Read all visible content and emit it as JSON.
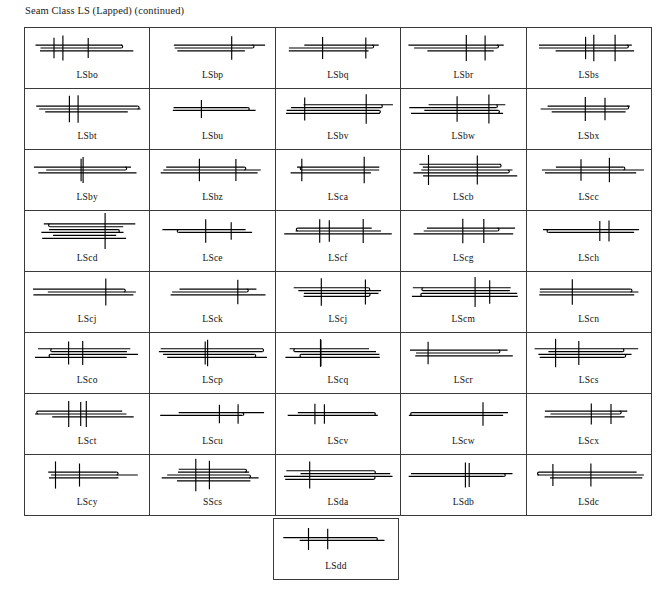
{
  "page": {
    "title": "Seam Class LS (Lapped) (continued)",
    "background_color": "#ffffff",
    "ink_color": "#000000",
    "border_color": "#2b2b2b"
  },
  "table": {
    "columns": 5,
    "rows": 9,
    "total_cells": 41,
    "rows_data": [
      {
        "cells": [
          {
            "label": "LSbo",
            "plies": 3,
            "folds": 2
          },
          {
            "label": "LSbp",
            "plies": 3,
            "folds": 1
          },
          {
            "label": "LSbq",
            "plies": 3,
            "folds": 2
          },
          {
            "label": "LSbr",
            "plies": 3,
            "folds": 2
          },
          {
            "label": "LSbs",
            "plies": 3,
            "folds": 1
          }
        ]
      },
      {
        "cells": [
          {
            "label": "LSbt",
            "plies": 3,
            "folds": 1
          },
          {
            "label": "LSbu",
            "plies": 2,
            "folds": 1
          },
          {
            "label": "LSbv",
            "plies": 4,
            "folds": 2
          },
          {
            "label": "LSbw",
            "plies": 4,
            "folds": 2
          },
          {
            "label": "LSbx",
            "plies": 3,
            "folds": 1
          }
        ]
      },
      {
        "cells": [
          {
            "label": "LSby",
            "plies": 3,
            "folds": 2
          },
          {
            "label": "LSbz",
            "plies": 3,
            "folds": 2
          },
          {
            "label": "LSca",
            "plies": 3,
            "folds": 1
          },
          {
            "label": "LScb",
            "plies": 5,
            "folds": 2
          },
          {
            "label": "LScc",
            "plies": 3,
            "folds": 1
          }
        ]
      },
      {
        "cells": [
          {
            "label": "LScd",
            "plies": 6,
            "folds": 2
          },
          {
            "label": "LSce",
            "plies": 2,
            "folds": 1
          },
          {
            "label": "LScf",
            "plies": 3,
            "folds": 1
          },
          {
            "label": "LScg",
            "plies": 3,
            "folds": 2
          },
          {
            "label": "LSch",
            "plies": 2,
            "folds": 1
          }
        ]
      },
      {
        "cells": [
          {
            "label": "LScj",
            "plies": 3,
            "folds": 2
          },
          {
            "label": "LSck",
            "plies": 3,
            "folds": 2
          },
          {
            "label": "LScj",
            "plies": 4,
            "folds": 3
          },
          {
            "label": "LScm",
            "plies": 4,
            "folds": 3
          },
          {
            "label": "LScn",
            "plies": 3,
            "folds": 3
          }
        ]
      },
      {
        "cells": [
          {
            "label": "LSco",
            "plies": 4,
            "folds": 3
          },
          {
            "label": "LScp",
            "plies": 4,
            "folds": 3
          },
          {
            "label": "LScq",
            "plies": 4,
            "folds": 3
          },
          {
            "label": "LScr",
            "plies": 3,
            "folds": 3
          },
          {
            "label": "LScs",
            "plies": 4,
            "folds": 2
          }
        ]
      },
      {
        "cells": [
          {
            "label": "LSct",
            "plies": 3,
            "folds": 2
          },
          {
            "label": "LScu",
            "plies": 2,
            "folds": 1
          },
          {
            "label": "LScv",
            "plies": 2,
            "folds": 0
          },
          {
            "label": "LScw",
            "plies": 2,
            "folds": 2
          },
          {
            "label": "LScx",
            "plies": 3,
            "folds": 2
          }
        ]
      },
      {
        "cells": [
          {
            "label": "LScy",
            "plies": 3,
            "folds": 1
          },
          {
            "label": "SScs",
            "plies": 5,
            "folds": 2
          },
          {
            "label": "LSda",
            "plies": 4,
            "folds": 2
          },
          {
            "label": "LSdb",
            "plies": 2,
            "folds": 2
          },
          {
            "label": "LSdc",
            "plies": 3,
            "folds": 2
          }
        ]
      },
      {
        "cells": [
          {
            "label": "LSdd",
            "plies": 2,
            "folds": 2
          }
        ]
      }
    ]
  },
  "labels_flat": [
    "LSbo",
    "LSbp",
    "LSbq",
    "LSbr",
    "LSbs",
    "LSbt",
    "LSbu",
    "LSbv",
    "LSbw",
    "LSbx",
    "LSby",
    "LSbz",
    "LSca",
    "LScb",
    "LScc",
    "LScd",
    "LSce",
    "LScf",
    "LScg",
    "LSch",
    "LScj",
    "LSck",
    "LScj",
    "LScm",
    "LScn",
    "LSco",
    "LScp",
    "LScq",
    "LScr",
    "LScs",
    "LSct",
    "LScu",
    "LScv",
    "LScw",
    "LScx",
    "LScy",
    "SScs",
    "LSda",
    "LSdb",
    "LSdc",
    "LSdd"
  ]
}
